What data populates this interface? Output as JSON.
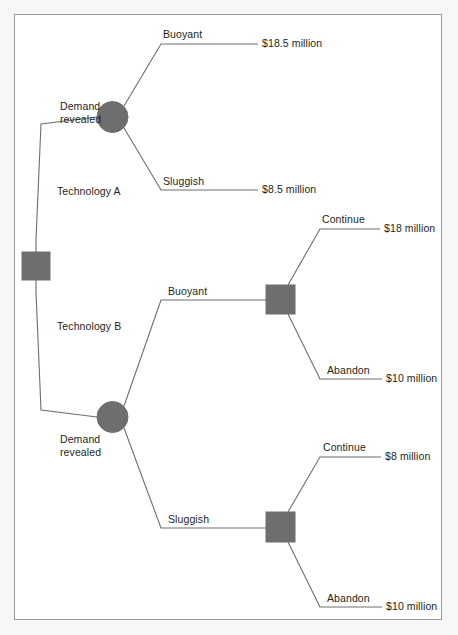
{
  "diagram": {
    "type": "decision-tree",
    "colors": {
      "node_fill": "#6e6e6e",
      "node_stroke": "#6e6e6e",
      "branch_line": "#6e6e6e",
      "text": "#231f20",
      "frame_border": "#9b9b9b",
      "page_background": "#f7f7f7",
      "canvas_background": "#ffffff"
    },
    "nodes": [
      {
        "id": "root",
        "shape": "square",
        "kind": "decision",
        "label": ""
      },
      {
        "id": "chance_a",
        "shape": "circle",
        "kind": "chance",
        "label": "Demand\nrevealed",
        "label_line1": "Demand",
        "label_line2": "revealed"
      },
      {
        "id": "chance_b",
        "shape": "circle",
        "kind": "chance",
        "label": "Demand\nrevealed",
        "label_line1": "Demand",
        "label_line2": "revealed"
      },
      {
        "id": "decision_b_buoyant",
        "shape": "square",
        "kind": "decision",
        "label": ""
      },
      {
        "id": "decision_b_sluggish",
        "shape": "square",
        "kind": "decision",
        "label": ""
      }
    ],
    "branches": [
      {
        "id": "tech_a",
        "from": "root",
        "to": "chance_a",
        "label": "Technology A"
      },
      {
        "id": "tech_b",
        "from": "root",
        "to": "chance_b",
        "label": "Technology B"
      },
      {
        "id": "a_buoyant",
        "from": "chance_a",
        "to": "leaf_1",
        "label": "Buoyant"
      },
      {
        "id": "a_sluggish",
        "from": "chance_a",
        "to": "leaf_2",
        "label": "Sluggish"
      },
      {
        "id": "b_buoyant",
        "from": "chance_b",
        "to": "decision_b_buoyant",
        "label": "Buoyant"
      },
      {
        "id": "b_sluggish",
        "from": "chance_b",
        "to": "decision_b_sluggish",
        "label": "Sluggish"
      },
      {
        "id": "bb_continue",
        "from": "decision_b_buoyant",
        "to": "leaf_3",
        "label": "Continue"
      },
      {
        "id": "bb_abandon",
        "from": "decision_b_buoyant",
        "to": "leaf_4",
        "label": "Abandon"
      },
      {
        "id": "bs_continue",
        "from": "decision_b_sluggish",
        "to": "leaf_5",
        "label": "Continue"
      },
      {
        "id": "bs_abandon",
        "from": "decision_b_sluggish",
        "to": "leaf_6",
        "label": "Abandon"
      }
    ],
    "payoffs": [
      {
        "id": "leaf_1",
        "value": "$18.5 million"
      },
      {
        "id": "leaf_2",
        "value": "$8.5 million"
      },
      {
        "id": "leaf_3",
        "value": "$18 million"
      },
      {
        "id": "leaf_4",
        "value": "$10 million"
      },
      {
        "id": "leaf_5",
        "value": "$8 million"
      },
      {
        "id": "leaf_6",
        "value": "$10 million"
      }
    ]
  }
}
